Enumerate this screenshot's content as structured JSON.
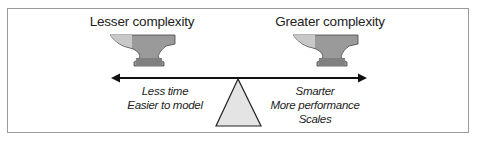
{
  "diagram": {
    "left": {
      "title": "Lesser complexity",
      "notes": [
        "Less time",
        "Easier to model"
      ]
    },
    "right": {
      "title": "Greater complexity",
      "notes": [
        "Smarter",
        "More performance",
        "Scales"
      ]
    },
    "colors": {
      "anvil_light": "#c8c8c8",
      "anvil_mid": "#9a9a9a",
      "anvil_dark": "#7f7f7f",
      "fulcrum": "#e4e4e4",
      "line": "#111111",
      "border": "#9a9a9a"
    }
  }
}
